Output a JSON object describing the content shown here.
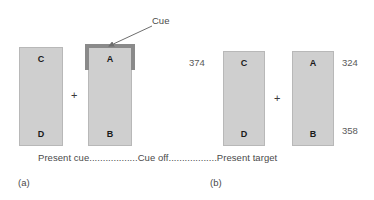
{
  "figure": {
    "timeline_caption": "Present cue..................Cue off..................Present target"
  },
  "panel_a": {
    "label": "(a)",
    "cue_label": "Cue",
    "arrow_icon": "arrow-pointing-to-cue",
    "left_rect": {
      "top_letter": "C",
      "bottom_letter": "D"
    },
    "right_rect": {
      "top_letter": "A",
      "bottom_letter": "B"
    },
    "fixation": "+"
  },
  "panel_b": {
    "label": "(b)",
    "left_rect": {
      "top_letter": "C",
      "bottom_letter": "D",
      "top_value": "374"
    },
    "right_rect": {
      "top_letter": "A",
      "bottom_letter": "B",
      "top_value": "324",
      "bottom_value": "358"
    },
    "fixation": "+"
  },
  "colors": {
    "rect_fill": "#cfcfcf",
    "rect_border": "#b8b8b8",
    "cue_border": "#8a8a8a",
    "text": "#4a4a4a",
    "letter": "#1a1a1a",
    "background": "#ffffff"
  }
}
